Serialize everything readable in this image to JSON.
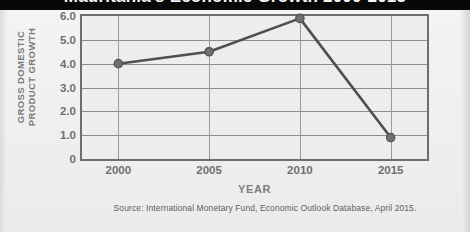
{
  "banner": {
    "title": "Mauritania's Economic Growth 2000-2015"
  },
  "axes": {
    "y_title_line1": "GROSS DOMESTIC",
    "y_title_line2": "PRODUCT GROWTH",
    "x_title": "YEAR"
  },
  "source": {
    "text": "Source: International Monetary Fund, Economic Outlook Database, April 2015."
  },
  "colors": {
    "banner_background": "#080808",
    "banner_text": "#f6f6f6",
    "plot_background": "#ededed",
    "plot_border": "#6e6e6e",
    "gridline": "#8d8d8d",
    "series_line": "#4f4f4f",
    "marker_fill": "#707070",
    "label_text": "#6f6f6f",
    "page_background": "#efefef"
  },
  "chart_data": {
    "type": "line",
    "title": "Mauritania's Economic Growth 2000-2015",
    "xlabel": "YEAR",
    "ylabel": "GROSS DOMESTIC PRODUCT GROWTH",
    "x": [
      2000,
      2005,
      2010,
      2015
    ],
    "xtick_labels": [
      "2000",
      "2005",
      "2010",
      "2015"
    ],
    "values": [
      4.0,
      4.5,
      5.9,
      0.9
    ],
    "ytick_labels": [
      "0",
      "1.0",
      "2.0",
      "3.0",
      "4.0",
      "5.0",
      "6.0"
    ],
    "ytick_values": [
      0,
      1.0,
      2.0,
      3.0,
      4.0,
      5.0,
      6.0
    ],
    "ylim": [
      0,
      6.0
    ],
    "xlim": [
      1998,
      2017
    ],
    "grid": true,
    "legend": false,
    "markers": true,
    "annotations": [
      "Source: International Monetary Fund, Economic Outlook Database, April 2015."
    ]
  }
}
